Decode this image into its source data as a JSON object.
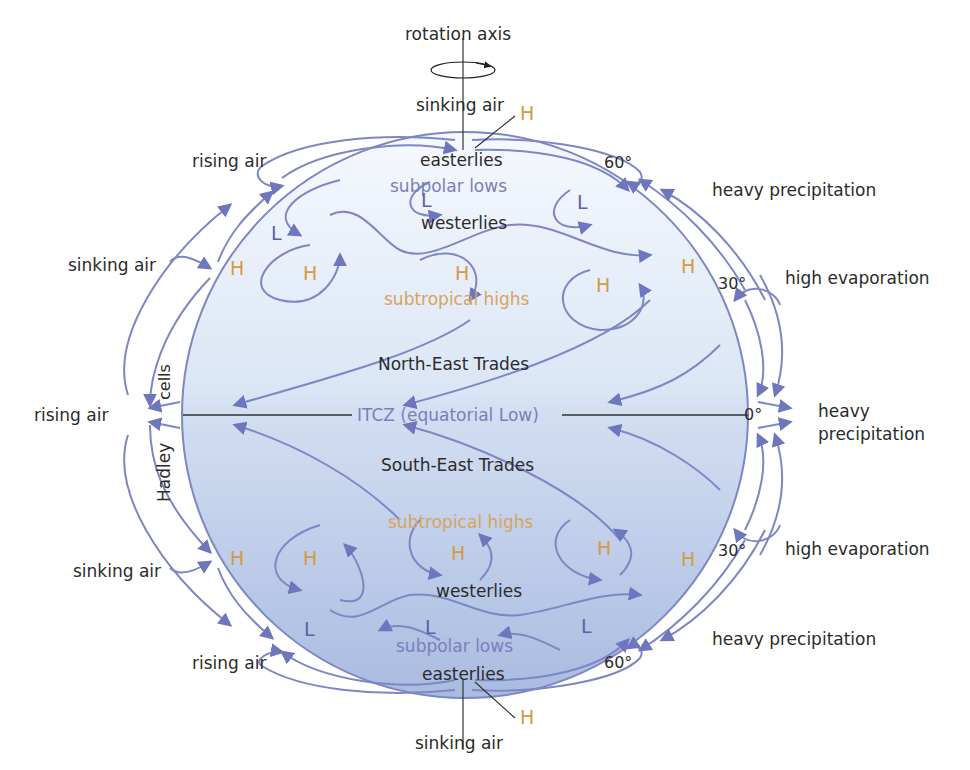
{
  "diagram": {
    "colors": {
      "flow_arrows": "#7e86c4",
      "globe_fill_top": "#f4f8fd",
      "globe_fill_bottom": "#aebfe0",
      "pressure_high": "#d39a48",
      "pressure_low": "#5a62a8",
      "zone_label_blue": "#7a80b8",
      "zone_label_gold": "#d8a45a",
      "text": "#2b2b2b"
    },
    "axis": {
      "label": "rotation axis"
    },
    "left_labels": {
      "north_rising": "rising air",
      "north_sinking": "sinking air",
      "equator_rising": "rising air",
      "south_sinking": "sinking air",
      "south_rising": "rising air",
      "hadley_top": "cells",
      "hadley_bottom": "Hadley"
    },
    "top_labels": {
      "sinking": "sinking air",
      "high": "H"
    },
    "bottom_labels": {
      "sinking": "sinking air",
      "high": "H"
    },
    "right_labels": {
      "north_60": "heavy precipitation",
      "north_30": "high evaporation",
      "equator_line1": "heavy",
      "equator_line2": "precipitation",
      "south_30": "high evaporation",
      "south_60": "heavy precipitation"
    },
    "latitudes": {
      "n60": "60°",
      "n30": "30°",
      "eq": "0°",
      "s30": "30°",
      "s60": "60°"
    },
    "zones": {
      "north_easterlies": "easterlies",
      "north_subpolar": "subpolar lows",
      "north_westerlies": "westerlies",
      "north_subtropical": "subtropical highs",
      "ne_trades": "North-East Trades",
      "itcz": "ITCZ (equatorial Low)",
      "se_trades": "South-East Trades",
      "south_subtropical": "subtropical highs",
      "south_westerlies": "westerlies",
      "south_subpolar": "subpolar lows",
      "south_easterlies": "easterlies"
    },
    "pressure_markers": {
      "high": "H",
      "low": "L"
    }
  }
}
